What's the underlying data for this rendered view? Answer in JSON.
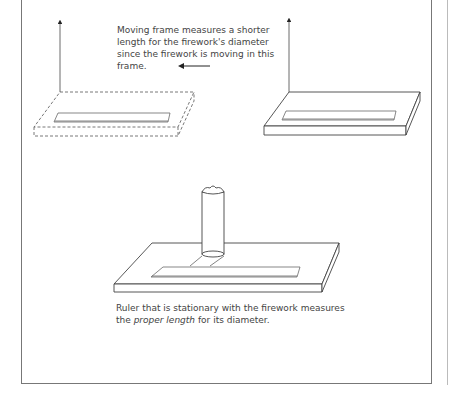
{
  "captions": {
    "moving_frame": "Moving frame measures a shorter length for the firework's diameter since the firework is moving in this frame.",
    "stationary_pre": "Ruler that is stationary with the firework measures the ",
    "stationary_em": "proper length",
    "stationary_post": " for its diameter."
  },
  "diagram": {
    "frames": [
      "moving-frame-dashed",
      "stationary-frame-right",
      "firework-frame-bottom"
    ],
    "motion_direction": "left"
  }
}
